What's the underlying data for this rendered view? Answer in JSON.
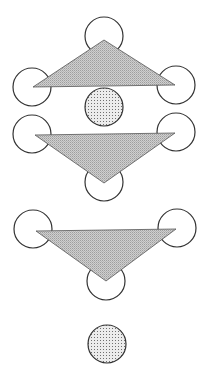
{
  "diagram": {
    "colors": {
      "background": "#ffffff",
      "stroke": "#333333",
      "triangle_fill": "#c6c6c6",
      "triangle_stipple": "#9a9a9a",
      "dot_fill": "#e4e4e4",
      "dot_stipple": "#6f6f6f"
    },
    "circle_radius": 19,
    "groups": [
      {
        "name": "group-1",
        "orientation": "apex-up",
        "triangle": [
          [
            104,
            40
          ],
          [
            33,
            87
          ],
          [
            175,
            85
          ]
        ],
        "vertex_circles": [
          [
            104,
            36
          ],
          [
            32,
            87
          ],
          [
            176,
            85
          ]
        ],
        "dotted_circles": [
          [
            104,
            107
          ]
        ]
      },
      {
        "name": "group-2",
        "orientation": "apex-down",
        "triangle": [
          [
            35,
            135
          ],
          [
            175,
            133
          ],
          [
            104,
            183
          ]
        ],
        "vertex_circles": [
          [
            32,
            134
          ],
          [
            176,
            132
          ],
          [
            104,
            182
          ]
        ],
        "dotted_circles": []
      },
      {
        "name": "group-3",
        "orientation": "apex-down",
        "triangle": [
          [
            36,
            231
          ],
          [
            176,
            229
          ],
          [
            106,
            281
          ]
        ],
        "vertex_circles": [
          [
            33,
            229
          ],
          [
            177,
            228
          ],
          [
            106,
            281
          ]
        ],
        "dotted_circles": [
          [
            107,
            344
          ]
        ]
      }
    ]
  }
}
